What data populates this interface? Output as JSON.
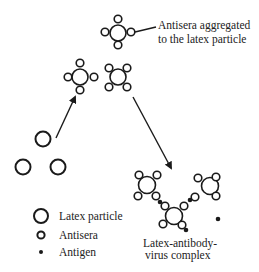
{
  "diagram": {
    "labels": {
      "aggregated_line1": "Antisera aggregated",
      "aggregated_line2": "to the latex particle",
      "complex_line1": "Latex-antibody-",
      "complex_line2": "virus complex"
    },
    "legend": {
      "items": [
        {
          "symbol": "large-open-circle",
          "label": "Latex particle"
        },
        {
          "symbol": "small-open-circle",
          "label": "Antisera"
        },
        {
          "symbol": "filled-dot",
          "label": "Antigen"
        }
      ]
    },
    "colors": {
      "stroke": "#1a1a1a",
      "background": "#ffffff",
      "text": "#222222"
    }
  }
}
